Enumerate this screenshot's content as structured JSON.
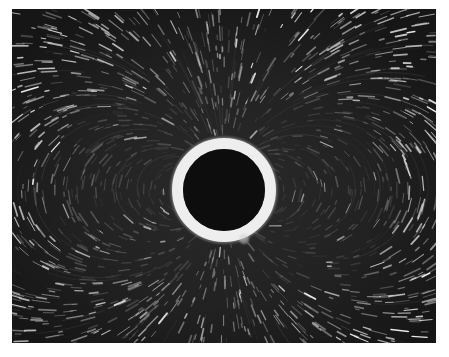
{
  "image": {
    "subject": "streak photograph of flow field around a circular cylinder",
    "alt": "Black-and-white streak photograph showing particle traces forming dipole-like loops around a bright ring with a dark center",
    "frame": {
      "x": 12,
      "y": 9,
      "width": 424,
      "height": 334
    },
    "background_color": "#1c1c1c",
    "page_color": "#ffffff",
    "cylinder": {
      "center_x": 212,
      "center_y": 181,
      "outer_radius": 52,
      "inner_radius": 41,
      "ring_color": "#eeeeee",
      "core_color": "#0d0d0d"
    },
    "streak_color": "#e8e8e8",
    "streak_count": 1400,
    "small_glint": {
      "x": 232,
      "y": 230,
      "radius": 5
    }
  }
}
